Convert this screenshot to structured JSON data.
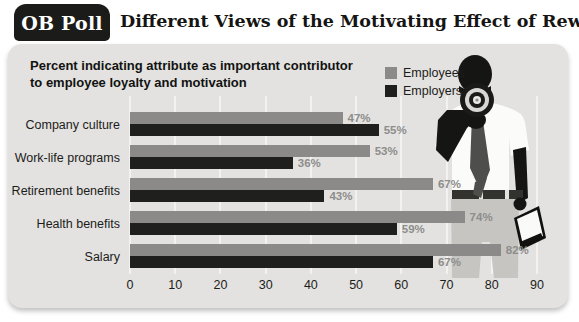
{
  "header": {
    "badge_label": "OB Poll",
    "title": "Different Views of the Motivating Effect of Rewards"
  },
  "chart_data": {
    "type": "bar",
    "orientation": "horizontal",
    "title": "Percent indicating attribute as important contributor to employee loyalty and motivation",
    "title_lines": [
      "Percent indicating attribute as important contributor",
      "to employee loyalty and motivation"
    ],
    "categories": [
      "Company culture",
      "Work-life programs",
      "Retirement benefits",
      "Health benefits",
      "Salary"
    ],
    "series": [
      {
        "name": "Employees",
        "color": "#8b8a88",
        "values": [
          47,
          53,
          67,
          74,
          82
        ]
      },
      {
        "name": "Employers",
        "color": "#1f1f1d",
        "values": [
          55,
          36,
          43,
          59,
          67
        ]
      }
    ],
    "value_suffix": "%",
    "value_label_color": "#8d8d8b",
    "xlabel": "",
    "ylabel": "",
    "xlim": [
      0,
      92
    ],
    "x_ticks": [
      0,
      10,
      20,
      30,
      40,
      50,
      60,
      70,
      80,
      90
    ],
    "grid": true,
    "legend_position": "top-right"
  },
  "illustration": {
    "name": "man-announcing-with-megaphone"
  },
  "colors": {
    "panel_bg": "#e3e2e0",
    "badge_bg": "#1b1b19",
    "grid_line": "#f2f1ef",
    "silhouette": "#151513",
    "shirt": "#fbfbfa",
    "tie": "#4e4e4c",
    "pants": "#c6c5c2"
  }
}
